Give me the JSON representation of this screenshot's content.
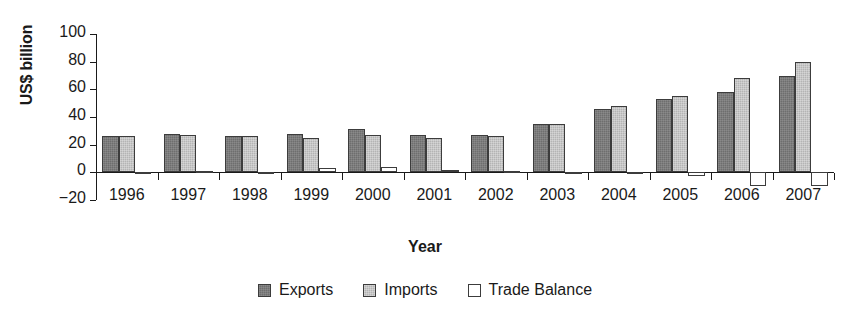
{
  "chart_data": {
    "type": "bar",
    "title": "",
    "xlabel": "Year",
    "ylabel": "US$ billion",
    "categories": [
      "1996",
      "1997",
      "1998",
      "1999",
      "2000",
      "2001",
      "2002",
      "2003",
      "2004",
      "2005",
      "2006",
      "2007"
    ],
    "series": [
      {
        "name": "Exports",
        "color": "#6e6e6e",
        "values": [
          26,
          28,
          26,
          28,
          31,
          27,
          27,
          35,
          46,
          53,
          58,
          70
        ]
      },
      {
        "name": "Imports",
        "color": "#b4b4b4",
        "values": [
          26,
          27,
          26,
          25,
          27,
          25,
          26,
          35,
          48,
          55,
          68,
          80
        ]
      },
      {
        "name": "Trade Balance",
        "color": "#ffffff",
        "values": [
          0,
          1,
          0,
          3,
          4,
          2,
          1,
          0.5,
          -1,
          -3,
          -10,
          -10
        ]
      }
    ],
    "ylim": [
      -20,
      100
    ],
    "yticks": [
      -20,
      0,
      20,
      40,
      60,
      80,
      100
    ],
    "ytick_labels": [
      "−20",
      "0",
      "20",
      "40",
      "60",
      "80",
      "100"
    ],
    "grid": false,
    "legend_position": "bottom"
  }
}
